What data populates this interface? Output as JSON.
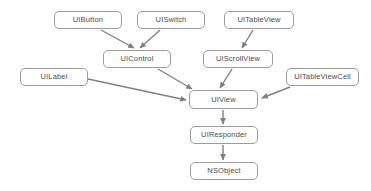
{
  "diagram": {
    "type": "class-hierarchy",
    "background_color": "#ffffff",
    "node_fill": "#ffffff",
    "node_border_color": "#9b9b9b",
    "node_text_color": "#4a4a4a",
    "edge_color": "#808080",
    "nodes": [
      {
        "id": "uibutton",
        "label": "UIButton",
        "x": 54,
        "y": 11,
        "w": 68,
        "h": 18
      },
      {
        "id": "uiswitch",
        "label": "UISwitch",
        "x": 137,
        "y": 11,
        "w": 68,
        "h": 18
      },
      {
        "id": "uitableview",
        "label": "UITableView",
        "x": 224,
        "y": 11,
        "w": 70,
        "h": 18
      },
      {
        "id": "uicontrol",
        "label": "UIControl",
        "x": 103,
        "y": 50,
        "w": 68,
        "h": 18
      },
      {
        "id": "uiscrollview",
        "label": "UIScrollView",
        "x": 203,
        "y": 50,
        "w": 70,
        "h": 18
      },
      {
        "id": "uilabel",
        "label": "UILabel",
        "x": 20,
        "y": 68,
        "w": 68,
        "h": 18
      },
      {
        "id": "uitableviewcell",
        "label": "UITableViewCell",
        "x": 286,
        "y": 68,
        "w": 73,
        "h": 18
      },
      {
        "id": "uiview",
        "label": "UIView",
        "x": 189,
        "y": 90,
        "w": 69,
        "h": 19
      },
      {
        "id": "uiresponder",
        "label": "UIResponder",
        "x": 190,
        "y": 126,
        "w": 68,
        "h": 18
      },
      {
        "id": "nsobject",
        "label": "NSObject",
        "x": 190,
        "y": 162,
        "w": 68,
        "h": 18
      }
    ],
    "edges": [
      {
        "from": "uibutton",
        "to": "uicontrol",
        "x1": 101,
        "y1": 30,
        "x2": 134,
        "y2": 48
      },
      {
        "from": "uiswitch",
        "to": "uicontrol",
        "x1": 160,
        "y1": 30,
        "x2": 140,
        "y2": 48
      },
      {
        "from": "uitableview",
        "to": "uiscrollview",
        "x1": 253,
        "y1": 30,
        "x2": 242,
        "y2": 48
      },
      {
        "from": "uicontrol",
        "to": "uiview",
        "x1": 158,
        "y1": 69,
        "x2": 192,
        "y2": 89
      },
      {
        "from": "uiscrollview",
        "to": "uiview",
        "x1": 232,
        "y1": 69,
        "x2": 220,
        "y2": 88
      },
      {
        "from": "uilabel",
        "to": "uiview",
        "x1": 88,
        "y1": 79,
        "x2": 186,
        "y2": 100
      },
      {
        "from": "uitableviewcell",
        "to": "uiview",
        "x1": 290,
        "y1": 87,
        "x2": 262,
        "y2": 98
      },
      {
        "from": "uiview",
        "to": "uiresponder",
        "x1": 223,
        "y1": 110,
        "x2": 223,
        "y2": 124
      },
      {
        "from": "uiresponder",
        "to": "nsobject",
        "x1": 223,
        "y1": 145,
        "x2": 223,
        "y2": 160
      }
    ]
  }
}
